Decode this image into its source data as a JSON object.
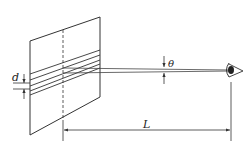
{
  "diagram": {
    "type": "physics-optics-grating-observation",
    "labels": {
      "slit_spacing": "d",
      "angle": "θ",
      "distance": "L"
    },
    "elements": [
      {
        "name": "grating-panel",
        "description": "parallelogram screen with parallel slanted lines (slits)"
      },
      {
        "name": "dashed-center-line",
        "description": "dashed vertical line on panel"
      },
      {
        "name": "light-rays",
        "description": "two nearly parallel rays converging to eye"
      },
      {
        "name": "eye",
        "description": "observer eye"
      },
      {
        "name": "distance-dimension",
        "description": "horizontal dimension arrow labelled L"
      }
    ],
    "colors": {
      "stroke": "#333333",
      "background": "#ffffff"
    }
  }
}
